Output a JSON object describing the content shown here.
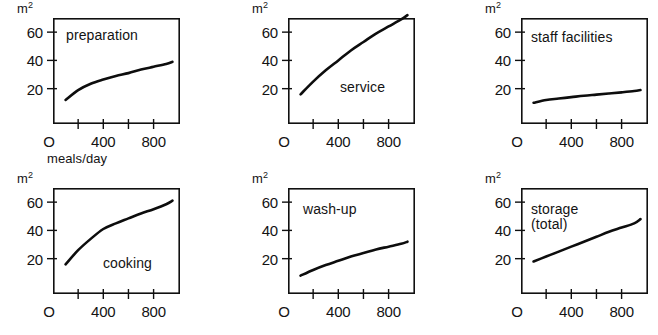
{
  "figure": {
    "axis_caption": "meals/day",
    "unit_label": "m2",
    "unit_label_base": "m",
    "unit_label_exp": "2",
    "y_ticks": [
      "60",
      "40",
      "20"
    ],
    "x_ticks": [
      "O",
      "400",
      "800"
    ],
    "line_color": "#0d0d0d",
    "frame_color": "#101010",
    "background": "#ffffff"
  },
  "chart_data": [
    {
      "type": "line",
      "title": "preparation",
      "xlabel": "meals/day",
      "ylabel": "m2",
      "xlim": [
        0,
        1010
      ],
      "ylim": [
        -5,
        70
      ],
      "x_ticks": [
        200,
        400,
        600,
        800
      ],
      "x_tick_labels": [
        "O",
        "400",
        "800"
      ],
      "y_ticks": [
        20,
        40,
        60
      ],
      "grid": false,
      "x": [
        100,
        200,
        300,
        400,
        500,
        600,
        700,
        800,
        900,
        950
      ],
      "values": [
        12,
        19,
        23.5,
        26.5,
        29,
        31,
        33.5,
        35.5,
        37.5,
        39
      ]
    },
    {
      "type": "line",
      "title": "service",
      "xlabel": "meals/day",
      "ylabel": "m2",
      "xlim": [
        0,
        1010
      ],
      "ylim": [
        -5,
        70
      ],
      "x_ticks": [
        200,
        400,
        600,
        800
      ],
      "x_tick_labels": [
        "O",
        "400",
        "800"
      ],
      "y_ticks": [
        20,
        40,
        60
      ],
      "grid": false,
      "x": [
        100,
        200,
        300,
        400,
        500,
        600,
        700,
        800,
        900,
        950
      ],
      "values": [
        16,
        25,
        33,
        40,
        47,
        53,
        59,
        64,
        69,
        72
      ]
    },
    {
      "type": "line",
      "title": "staff facilities",
      "xlabel": "meals/day",
      "ylabel": "m2",
      "xlim": [
        0,
        1010
      ],
      "ylim": [
        -5,
        70
      ],
      "x_ticks": [
        200,
        400,
        600,
        800
      ],
      "x_tick_labels": [
        "O",
        "400",
        "800"
      ],
      "y_ticks": [
        20,
        40,
        60
      ],
      "grid": false,
      "x": [
        100,
        200,
        300,
        400,
        500,
        600,
        700,
        800,
        900,
        950
      ],
      "values": [
        10,
        12,
        13,
        14,
        15,
        15.8,
        16.6,
        17.4,
        18.3,
        19
      ]
    },
    {
      "type": "line",
      "title": "cooking",
      "xlabel": "meals/day",
      "ylabel": "m2",
      "xlim": [
        0,
        1010
      ],
      "ylim": [
        -5,
        70
      ],
      "x_ticks": [
        200,
        400,
        600,
        800
      ],
      "x_tick_labels": [
        "O",
        "400",
        "800"
      ],
      "y_ticks": [
        20,
        40,
        60
      ],
      "grid": false,
      "x": [
        100,
        200,
        300,
        400,
        500,
        600,
        700,
        800,
        900,
        950
      ],
      "values": [
        16,
        26,
        34,
        41,
        45,
        48.5,
        52,
        55,
        58.5,
        61
      ]
    },
    {
      "type": "line",
      "title": "wash-up",
      "xlabel": "meals/day",
      "ylabel": "m2",
      "xlim": [
        0,
        1010
      ],
      "ylim": [
        -5,
        70
      ],
      "x_ticks": [
        200,
        400,
        600,
        800
      ],
      "x_tick_labels": [
        "O",
        "400",
        "800"
      ],
      "y_ticks": [
        20,
        40,
        60
      ],
      "grid": false,
      "x": [
        100,
        200,
        300,
        400,
        500,
        600,
        700,
        800,
        900,
        950
      ],
      "values": [
        8,
        12,
        15.5,
        18.5,
        21.5,
        24,
        26.5,
        28.5,
        30.5,
        32
      ]
    },
    {
      "type": "line",
      "title": "storage\n(total)",
      "xlabel": "meals/day",
      "ylabel": "m2",
      "xlim": [
        0,
        1010
      ],
      "ylim": [
        -5,
        70
      ],
      "x_ticks": [
        200,
        400,
        600,
        800
      ],
      "x_tick_labels": [
        "O",
        "400",
        "800"
      ],
      "y_ticks": [
        20,
        40,
        60
      ],
      "grid": false,
      "x": [
        100,
        200,
        300,
        400,
        500,
        600,
        700,
        800,
        900,
        950
      ],
      "values": [
        18,
        21.5,
        25,
        28.5,
        32,
        35.5,
        39,
        42,
        45,
        48
      ]
    }
  ],
  "panels": [
    {
      "title": "preparation",
      "title_left": 13,
      "title_top": 10,
      "has_axis_caption": true
    },
    {
      "title": "service",
      "title_left": 52,
      "title_top": 62,
      "has_axis_caption": false
    },
    {
      "title": "staff facilities",
      "title_left": 10,
      "title_top": 12,
      "has_axis_caption": false
    },
    {
      "title": "cooking",
      "title_left": 50,
      "title_top": 68,
      "has_axis_caption": false
    },
    {
      "title": "wash-up",
      "title_left": 15,
      "title_top": 14,
      "has_axis_caption": false
    },
    {
      "title": "storage\n(total)",
      "title_left": 10,
      "title_top": 14,
      "has_axis_caption": false
    }
  ]
}
